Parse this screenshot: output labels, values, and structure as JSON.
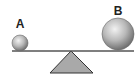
{
  "diagram": {
    "type": "balance-seesaw",
    "labels": {
      "a": "A",
      "b": "B"
    },
    "objects": [
      {
        "id": "sphere-a",
        "label": "A",
        "cx": 20,
        "cy": 43,
        "r": 8
      },
      {
        "id": "sphere-b",
        "label": "B",
        "cx": 118,
        "cy": 34,
        "r": 16
      }
    ],
    "beam": {
      "x1": 12,
      "y1": 51,
      "x2": 134,
      "y2": 51
    },
    "fulcrum": {
      "apex": [
        71,
        51
      ],
      "base_left": [
        50,
        73
      ],
      "base_right": [
        93,
        73
      ]
    },
    "colors": {
      "sphere_light": "#e8e8e8",
      "sphere_dark": "#7a7a7a",
      "beam": "#555555",
      "fulcrum_fill": "#a9a9a9",
      "fulcrum_stroke": "#333333",
      "label": "#222222"
    }
  }
}
